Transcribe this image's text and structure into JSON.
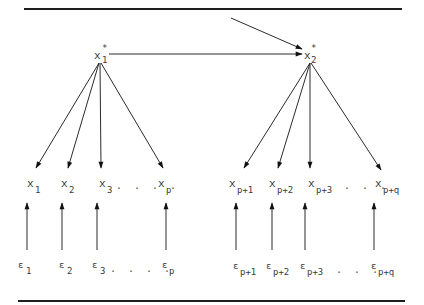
{
  "diagram": {
    "type": "path-diagram (factor model)",
    "latent_factors": [
      {
        "id": "xi1",
        "symbol": "x",
        "sub": "1",
        "sup": "*",
        "label": "x1*"
      },
      {
        "id": "xi2",
        "symbol": "x",
        "sub": "2",
        "sup": "*",
        "label": "x2*"
      }
    ],
    "structural_paths": [
      {
        "from": "external",
        "to": "xi2"
      },
      {
        "from": "xi1",
        "to": "xi2"
      }
    ],
    "indicators_left": [
      {
        "symbol": "x",
        "sub": "1"
      },
      {
        "symbol": "x",
        "sub": "2"
      },
      {
        "symbol": "x",
        "sub": "3"
      },
      {
        "symbol": "x",
        "sub": "p"
      }
    ],
    "indicators_right": [
      {
        "symbol": "x",
        "sub": "p+1"
      },
      {
        "symbol": "x",
        "sub": "p+2"
      },
      {
        "symbol": "x",
        "sub": "p+3"
      },
      {
        "symbol": "x",
        "sub": "p+q"
      }
    ],
    "errors_left": [
      {
        "symbol": "ε",
        "sub": "1"
      },
      {
        "symbol": "ε",
        "sub": "2"
      },
      {
        "symbol": "ε",
        "sub": "3"
      },
      {
        "symbol": "ε",
        "sub": "p"
      }
    ],
    "errors_right": [
      {
        "symbol": "ε",
        "sub": "p+1"
      },
      {
        "symbol": "ε",
        "sub": "p+2"
      },
      {
        "symbol": "ε",
        "sub": "p+3"
      },
      {
        "symbol": "ε",
        "sub": "p+q"
      }
    ],
    "ellipsis": ". . . .",
    "ellipsis_short": ". . .",
    "colors": {
      "ink": "#2b2b2b",
      "background": "#ffffff"
    }
  }
}
